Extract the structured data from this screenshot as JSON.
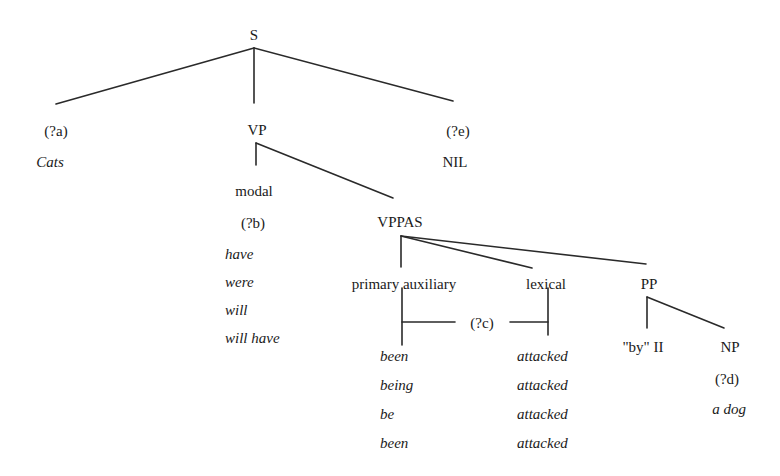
{
  "tree": {
    "root": "S",
    "subject": {
      "slot": "(?a)",
      "value": "Cats"
    },
    "vp": "VP",
    "extra": {
      "slot": "(?e)",
      "value": "NIL"
    },
    "modal": {
      "label": "modal",
      "slot": "(?b)",
      "values": [
        "have",
        "were",
        "will",
        "will have"
      ]
    },
    "vppas": "VPPAS",
    "primary_auxiliary": {
      "label": "primary auxiliary",
      "values": [
        "been",
        "being",
        "be",
        "been"
      ]
    },
    "lexical": {
      "label": "lexical",
      "values": [
        "attacked",
        "attacked",
        "attacked",
        "attacked"
      ]
    },
    "agreement_slot": "(?c)",
    "pp": {
      "label": "PP",
      "prep": "\"by\" II",
      "np": "NP",
      "np_slot": "(?d)",
      "np_value": "a dog"
    }
  }
}
